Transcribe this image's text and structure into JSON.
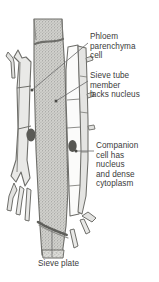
{
  "figure": {
    "background_color": "#ffffff",
    "text_color": "#3b3b3b",
    "leader_color": "#6f6f6f",
    "wall_color": "#6b6b6b",
    "parenchyma_fill": "#e9e9e7",
    "sieve_tube_fill": "#d6d6d2",
    "companion_fill": "#fbfbfa",
    "nucleus_color": "#545454"
  },
  "labels": {
    "phloem_parenchyma": "Phloem\nparenchyma\ncell",
    "sieve_tube": "Sieve tube\nmember\nlacks nucleus",
    "companion_cell": "Companion\ncell has\nnucleus\nand dense\ncytoplasm",
    "sieve_plate": "Sieve plate"
  },
  "structures": [
    {
      "name": "phloem-parenchyma-cell",
      "label_key": "phloem_parenchyma"
    },
    {
      "name": "sieve-tube-member",
      "label_key": "sieve_tube"
    },
    {
      "name": "companion-cell",
      "label_key": "companion_cell"
    },
    {
      "name": "sieve-plate",
      "label_key": "sieve_plate"
    }
  ]
}
